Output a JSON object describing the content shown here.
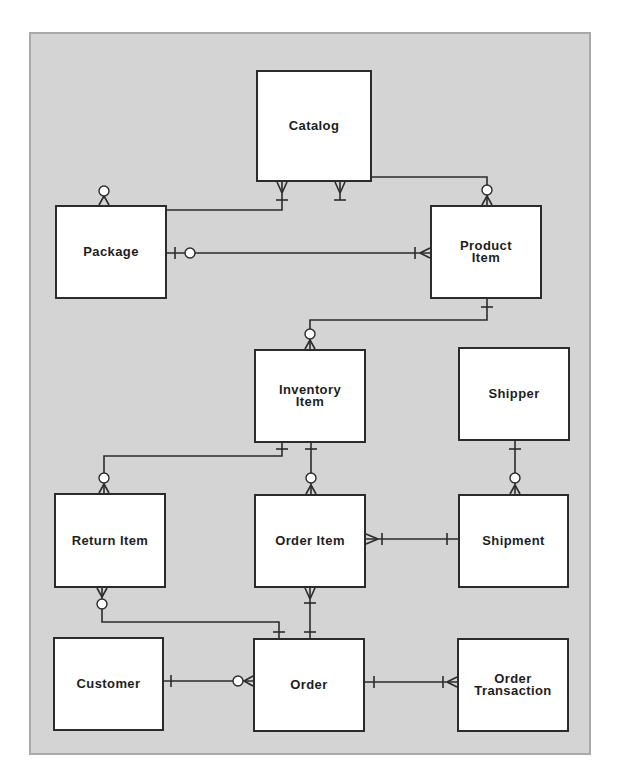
{
  "diagram": {
    "type": "entity-relationship",
    "colors": {
      "background": "#d4d4d4",
      "frame_border": "#a9a9a9",
      "entity_fill": "#ffffff",
      "line": "#2b2b2b",
      "text": "#1e1e1e"
    },
    "entities": [
      {
        "id": "catalog",
        "label": "Catalog",
        "x": 256,
        "y": 70,
        "w": 116,
        "h": 112
      },
      {
        "id": "package",
        "label": "Package",
        "x": 55,
        "y": 205,
        "w": 112,
        "h": 94
      },
      {
        "id": "product_item",
        "label": "Product\nItem",
        "x": 430,
        "y": 205,
        "w": 112,
        "h": 94
      },
      {
        "id": "inventory_item",
        "label": "Inventory\nItem",
        "x": 254,
        "y": 349,
        "w": 112,
        "h": 94
      },
      {
        "id": "shipper",
        "label": "Shipper",
        "x": 458,
        "y": 347,
        "w": 112,
        "h": 94
      },
      {
        "id": "return_item",
        "label": "Return Item",
        "x": 54,
        "y": 493,
        "w": 112,
        "h": 95
      },
      {
        "id": "order_item",
        "label": "Order Item",
        "x": 254,
        "y": 494,
        "w": 112,
        "h": 94
      },
      {
        "id": "shipment",
        "label": "Shipment",
        "x": 458,
        "y": 494,
        "w": 111,
        "h": 94
      },
      {
        "id": "customer",
        "label": "Customer",
        "x": 53,
        "y": 637,
        "w": 111,
        "h": 94
      },
      {
        "id": "order",
        "label": "Order",
        "x": 253,
        "y": 638,
        "w": 112,
        "h": 94
      },
      {
        "id": "order_transaction",
        "label": "Order\nTransaction",
        "x": 457,
        "y": 638,
        "w": 112,
        "h": 94
      }
    ],
    "relationships": [
      {
        "from": "Catalog",
        "to": "Package",
        "from_cardinality": "one-or-many",
        "to_cardinality": "zero-or-many",
        "path": [
          [
            282,
            182
          ],
          [
            282,
            210
          ],
          [
            104,
            210
          ],
          [
            104,
            205
          ]
        ]
      },
      {
        "from": "Catalog",
        "to": "Product Item",
        "from_cardinality": "one-or-many",
        "to_cardinality": "zero-or-many",
        "path": [
          [
            340,
            182
          ],
          [
            340,
            177
          ],
          [
            487,
            177
          ],
          [
            487,
            205
          ]
        ]
      },
      {
        "from": "Package",
        "to": "Product Item",
        "from_cardinality": "zero-or-one",
        "to_cardinality": "one-or-many",
        "path": [
          [
            167,
            253
          ],
          [
            430,
            253
          ]
        ]
      },
      {
        "from": "Product Item",
        "to": "Inventory Item",
        "from_cardinality": "one",
        "to_cardinality": "zero-or-many",
        "path": [
          [
            487,
            299
          ],
          [
            487,
            320
          ],
          [
            310,
            320
          ],
          [
            310,
            349
          ]
        ]
      },
      {
        "from": "Inventory Item",
        "to": "Return Item",
        "from_cardinality": "one",
        "to_cardinality": "zero-or-many",
        "path": [
          [
            282,
            443
          ],
          [
            282,
            456
          ],
          [
            104,
            456
          ],
          [
            104,
            493
          ]
        ]
      },
      {
        "from": "Inventory Item",
        "to": "Order Item",
        "from_cardinality": "one",
        "to_cardinality": "zero-or-many",
        "path": [
          [
            311,
            443
          ],
          [
            311,
            494
          ]
        ]
      },
      {
        "from": "Shipper",
        "to": "Shipment",
        "from_cardinality": "one",
        "to_cardinality": "zero-or-many",
        "path": [
          [
            515,
            441
          ],
          [
            515,
            494
          ]
        ]
      },
      {
        "from": "Order Item",
        "to": "Shipment",
        "from_cardinality": "one-or-many",
        "to_cardinality": "one",
        "path": [
          [
            366,
            539
          ],
          [
            458,
            539
          ]
        ]
      },
      {
        "from": "Return Item",
        "to": "Order",
        "from_cardinality": "zero-or-many",
        "to_cardinality": "one",
        "path": [
          [
            102,
            588
          ],
          [
            102,
            622
          ],
          [
            279,
            622
          ],
          [
            279,
            638
          ]
        ]
      },
      {
        "from": "Order Item",
        "to": "Order",
        "from_cardinality": "one-or-many",
        "to_cardinality": "one",
        "path": [
          [
            310,
            588
          ],
          [
            310,
            638
          ]
        ]
      },
      {
        "from": "Customer",
        "to": "Order",
        "from_cardinality": "one",
        "to_cardinality": "zero-or-many",
        "path": [
          [
            164,
            681
          ],
          [
            253,
            681
          ]
        ]
      },
      {
        "from": "Order",
        "to": "Order Transaction",
        "from_cardinality": "one",
        "to_cardinality": "one-or-many",
        "path": [
          [
            365,
            682
          ],
          [
            457,
            682
          ]
        ]
      }
    ]
  }
}
